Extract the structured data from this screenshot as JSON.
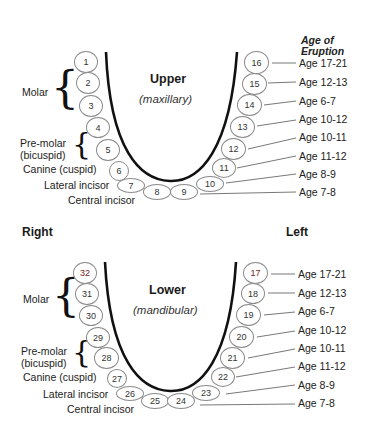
{
  "header": {
    "age_of_eruption": "Age of\nEruption",
    "age_line1": "Age of",
    "age_line2": "Eruption"
  },
  "sides": {
    "right": "Right",
    "left": "Left"
  },
  "upper": {
    "title": "Upper",
    "subtitle": "(maxillary)",
    "left_labels": {
      "molar": "Molar",
      "premolar_1": "Pre-molar",
      "premolar_2": "(bicuspid)",
      "canine": "Canine (cuspid)",
      "lateral": "Lateral incisor",
      "central": "Central incisor"
    },
    "teeth": [
      "1",
      "2",
      "3",
      "4",
      "5",
      "6",
      "7",
      "8",
      "9",
      "10",
      "11",
      "12",
      "13",
      "14",
      "15",
      "16"
    ],
    "ages": [
      "Age 17-21",
      "Age 12-13",
      "Age 6-7",
      "Age 10-12",
      "Age 10-11",
      "Age 11-12",
      "Age 8-9",
      "Age 7-8"
    ]
  },
  "lower": {
    "title": "Lower",
    "subtitle": "(mandibular)",
    "left_labels": {
      "molar": "Molar",
      "premolar_1": "Pre-molar",
      "premolar_2": "(bicuspid)",
      "canine": "Canine (cuspid)",
      "lateral": "Lateral incisor",
      "central": "Central incisor"
    },
    "teeth": [
      "32",
      "31",
      "30",
      "29",
      "28",
      "27",
      "26",
      "25",
      "24",
      "23",
      "22",
      "21",
      "20",
      "19",
      "18",
      "17"
    ],
    "ages": [
      "Age 17-21",
      "Age 12-13",
      "Age 6-7",
      "Age 10-12",
      "Age 10-11",
      "Age 11-12",
      "Age 8-9",
      "Age 7-8"
    ]
  },
  "colors": {
    "highlight_tooth_number": "#7a2424",
    "outline": "#8a8a8a",
    "arch": "#111111"
  }
}
